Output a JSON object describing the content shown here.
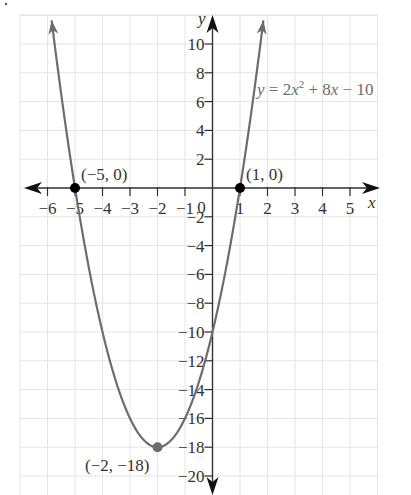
{
  "chart_data": {
    "type": "line",
    "title": "",
    "equation": "y = 2x² + 8x − 10",
    "equation_parts": {
      "pre": "y = 2x",
      "sup": "2",
      "post": " + 8x − 10"
    },
    "xlabel": "x",
    "ylabel": "y",
    "xlim": [
      -7,
      6
    ],
    "ylim": [
      -21,
      12
    ],
    "x_ticks": [
      -6,
      -5,
      -4,
      -3,
      -2,
      -1,
      1,
      2,
      3,
      4,
      5
    ],
    "x_tick_labels": [
      "−6",
      "−5",
      "−4",
      "−3",
      "−2",
      "−1",
      "1",
      "2",
      "3",
      "4",
      "5"
    ],
    "origin_label": "0",
    "y_ticks": [
      10,
      8,
      6,
      4,
      2,
      -2,
      -4,
      -6,
      -8,
      -10,
      -12,
      -14,
      -16,
      -18,
      -20
    ],
    "y_tick_labels": [
      "10",
      "8",
      "6",
      "4",
      "2",
      "−2",
      "−4",
      "−6",
      "−8",
      "−10",
      "−12",
      "−14",
      "−16",
      "−18",
      "−20"
    ],
    "grid": true,
    "series": [
      {
        "name": "y = 2x^2 + 8x - 10",
        "function": "2*x*x + 8*x - 10",
        "x_range": [
          -5.85,
          1.85
        ],
        "color": "#6d6d6d"
      }
    ],
    "points": [
      {
        "x": -5,
        "y": 0,
        "label": "(−5, 0)",
        "color": "#000000"
      },
      {
        "x": 1,
        "y": 0,
        "label": "(1, 0)",
        "color": "#000000"
      },
      {
        "x": -2,
        "y": -18,
        "label": "(−2, −18)",
        "color": "#6d6d6d"
      }
    ]
  },
  "colors": {
    "curve": "#6d6d6d",
    "axis": "#333333",
    "grid": "#e4e4e4"
  }
}
